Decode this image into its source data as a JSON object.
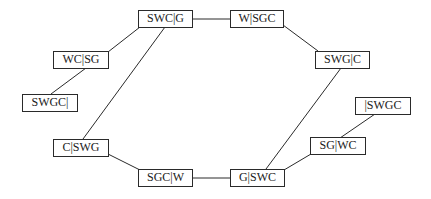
{
  "diagram": {
    "type": "state-space-graph",
    "nodes": [
      {
        "id": "swc_g",
        "label": "SWC|G"
      },
      {
        "id": "w_sgc",
        "label": "W|SGC"
      },
      {
        "id": "wc_sg",
        "label": "WC|SG"
      },
      {
        "id": "swg_c",
        "label": "SWG|C"
      },
      {
        "id": "swgc_",
        "label": "SWGC|"
      },
      {
        "id": "_swgc",
        "label": "|SWGC"
      },
      {
        "id": "c_swg",
        "label": "C|SWG"
      },
      {
        "id": "sg_wc",
        "label": "SG|WC"
      },
      {
        "id": "sgc_w",
        "label": "SGC|W"
      },
      {
        "id": "g_swc",
        "label": "G|SWC"
      }
    ],
    "edges": [
      [
        "swgc_",
        "wc_sg"
      ],
      [
        "wc_sg",
        "swc_g"
      ],
      [
        "swc_g",
        "w_sgc"
      ],
      [
        "swc_g",
        "c_swg"
      ],
      [
        "w_sgc",
        "swg_c"
      ],
      [
        "swg_c",
        "g_swc"
      ],
      [
        "c_swg",
        "sgc_w"
      ],
      [
        "sgc_w",
        "g_swc"
      ],
      [
        "g_swc",
        "sg_wc"
      ],
      [
        "sg_wc",
        "_swgc"
      ]
    ]
  }
}
